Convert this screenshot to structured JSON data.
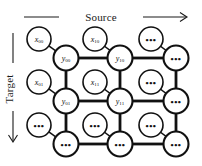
{
  "figure": {
    "type": "lattice-diagram",
    "axes": {
      "horizontal": {
        "label": "Source",
        "direction": "right",
        "arrow": "→"
      },
      "vertical": {
        "label": "Target",
        "direction": "down",
        "arrow": "↓"
      }
    },
    "ellipsis": "•••",
    "lattice": {
      "rows": 3,
      "cols": 3,
      "y_nodes": [
        [
          {
            "base": "y",
            "sub": "00",
            "cx": 66,
            "cy": 58
          },
          {
            "base": "y",
            "sub": "10",
            "cx": 120,
            "cy": 58
          },
          {
            "base": "",
            "sub": "",
            "dots": true,
            "cx": 176,
            "cy": 58
          }
        ],
        [
          {
            "base": "y",
            "sub": "01",
            "cx": 66,
            "cy": 101
          },
          {
            "base": "y",
            "sub": "11",
            "cx": 120,
            "cy": 101
          },
          {
            "base": "",
            "sub": "",
            "dots": true,
            "cx": 176,
            "cy": 101
          }
        ],
        [
          {
            "base": "",
            "sub": "",
            "dots": true,
            "cx": 66,
            "cy": 144
          },
          {
            "base": "",
            "sub": "",
            "dots": true,
            "cx": 120,
            "cy": 144
          },
          {
            "base": "",
            "sub": "",
            "dots": true,
            "cx": 176,
            "cy": 144
          }
        ]
      ],
      "x_nodes": [
        [
          {
            "base": "x",
            "sub": "00",
            "cx": 39,
            "cy": 39
          },
          {
            "base": "x",
            "sub": "10",
            "cx": 95,
            "cy": 39
          },
          {
            "base": "",
            "sub": "",
            "dots": true,
            "cx": 151,
            "cy": 39
          }
        ],
        [
          {
            "base": "x",
            "sub": "01",
            "cx": 39,
            "cy": 82
          },
          {
            "base": "x",
            "sub": "11",
            "cx": 95,
            "cy": 82
          },
          {
            "base": "",
            "sub": "",
            "dots": true,
            "cx": 151,
            "cy": 82
          }
        ],
        [
          {
            "base": "",
            "sub": "",
            "dots": true,
            "cx": 39,
            "cy": 125
          },
          {
            "base": "",
            "sub": "",
            "dots": true,
            "cx": 95,
            "cy": 125
          },
          {
            "base": "",
            "sub": "",
            "dots": true,
            "cx": 151,
            "cy": 125
          }
        ]
      ],
      "node_radius_x": 12,
      "node_radius_y": 12.5
    },
    "colors": {
      "stroke": "#111111",
      "node_fill": "#ffffff",
      "background": "#ffffff",
      "text": "#1a1a1a"
    }
  }
}
